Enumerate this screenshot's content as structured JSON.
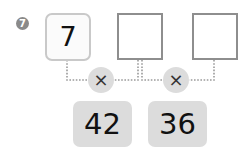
{
  "problem": {
    "number": "7",
    "given_value": "7",
    "answer_boxes": [
      "",
      ""
    ],
    "operators": [
      "×",
      "×"
    ],
    "results": [
      "42",
      "36"
    ]
  },
  "colors": {
    "badge": "#8a8a8a",
    "given_border": "#c9c9c9",
    "answer_border": "#8e8e8e",
    "operator_fill": "#dcdcdc",
    "result_fill": "#dcdcdc",
    "connector": "#9a9a9a"
  }
}
